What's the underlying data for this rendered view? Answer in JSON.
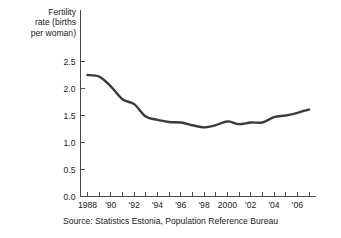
{
  "chart_data": {
    "type": "line",
    "title": "",
    "subtitle": "",
    "xlabel": "",
    "ylabel": "Fertility rate (births per woman)",
    "ylabel_lines": [
      "Fertility",
      "rate (births",
      "per woman)"
    ],
    "source": "Source:  Statistics Estonia, Population Reference Bureau",
    "grid": false,
    "legend": "none",
    "line_color": "#3b3b3b",
    "axis_color": "#4a4a4a",
    "xlim": [
      1987.4,
      2007.6
    ],
    "ylim": [
      0.0,
      2.62
    ],
    "yticks": [
      0.0,
      0.5,
      1.0,
      1.5,
      2.0,
      2.5
    ],
    "ytick_labels": [
      "0.0",
      "0.5",
      "1.0",
      "1.5",
      "2.0",
      "2.5"
    ],
    "xticks": [
      1988,
      1989,
      1990,
      1991,
      1992,
      1993,
      1994,
      1995,
      1996,
      1997,
      1998,
      1999,
      2000,
      2001,
      2002,
      2003,
      2004,
      2005,
      2006,
      2007
    ],
    "xtick_labels": [
      {
        "x": 1988,
        "label": "1988"
      },
      {
        "x": 1990,
        "label": "'90"
      },
      {
        "x": 1992,
        "label": "'92"
      },
      {
        "x": 1994,
        "label": "'94"
      },
      {
        "x": 1996,
        "label": "'96"
      },
      {
        "x": 1998,
        "label": "'98"
      },
      {
        "x": 2000,
        "label": "2000"
      },
      {
        "x": 2002,
        "label": "'02"
      },
      {
        "x": 2004,
        "label": "'04"
      },
      {
        "x": 2006,
        "label": "'06"
      }
    ],
    "x": [
      1988,
      1989,
      1990,
      1991,
      1992,
      1993,
      1994,
      1995,
      1996,
      1997,
      1998,
      1999,
      2000,
      2001,
      2002,
      2003,
      2004,
      2005,
      2006,
      2007
    ],
    "values": [
      2.25,
      2.22,
      2.04,
      1.8,
      1.71,
      1.48,
      1.42,
      1.38,
      1.37,
      1.32,
      1.28,
      1.32,
      1.39,
      1.34,
      1.37,
      1.37,
      1.47,
      1.5,
      1.55,
      1.61
    ],
    "series": [
      {
        "name": "Fertility rate",
        "values": [
          2.25,
          2.22,
          2.04,
          1.8,
          1.71,
          1.48,
          1.42,
          1.38,
          1.37,
          1.32,
          1.28,
          1.32,
          1.39,
          1.34,
          1.37,
          1.37,
          1.47,
          1.5,
          1.55,
          1.61
        ]
      }
    ]
  }
}
